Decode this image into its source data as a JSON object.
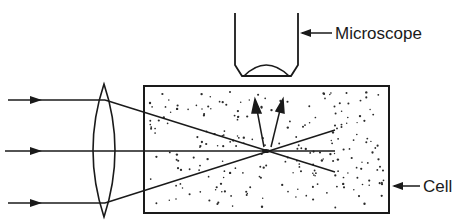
{
  "diagram": {
    "type": "optical-scattering-setup",
    "labels": {
      "microscope": "Microscope",
      "cell": "Cell"
    },
    "components": [
      {
        "name": "incident-rays",
        "count": 3
      },
      {
        "name": "converging-lens"
      },
      {
        "name": "scattering-cell",
        "contents": "suspended particles (dots)"
      },
      {
        "name": "focal-point"
      },
      {
        "name": "scattered-light-arrows",
        "count": 2
      },
      {
        "name": "microscope-objective"
      }
    ],
    "colors": {
      "line": "#1a1a1a",
      "background": "#ffffff"
    }
  }
}
